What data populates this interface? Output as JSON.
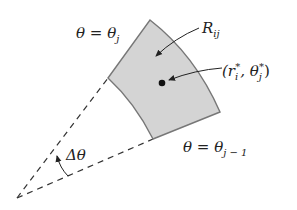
{
  "diagram": {
    "labels": {
      "theta_j_eq": "θ = θ",
      "theta_j_sub": "j",
      "region": "R",
      "region_sub": "ij",
      "point_open": "(r",
      "point_r_sub": "i",
      "point_star1": "*",
      "point_sep": ", θ",
      "point_theta_sub": "j",
      "point_star2": "*",
      "point_close": ")",
      "theta_j1_eq": "θ = θ",
      "theta_j1_sub": "j − 1",
      "delta_theta": "Δθ"
    },
    "colors": {
      "region_fill": "#d4d4d4",
      "region_stroke": "#777777",
      "ink": "#222222"
    }
  }
}
